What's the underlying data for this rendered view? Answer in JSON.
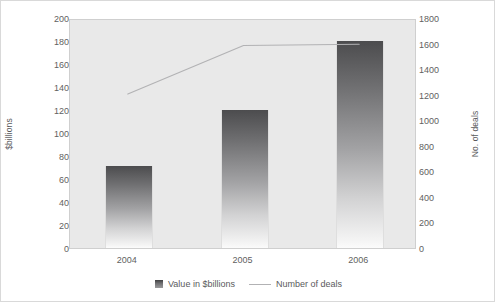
{
  "chart_data": {
    "type": "bar",
    "title": "",
    "subtitle": "",
    "xlabel": "",
    "categories": [
      "2004",
      "2005",
      "2006"
    ],
    "grid": false,
    "legend_position": "bottom",
    "series": [
      {
        "name": "Value in $billions",
        "type": "bar",
        "axis": "left",
        "values": [
          71,
          120,
          180
        ]
      },
      {
        "name": "Number of deals",
        "type": "line",
        "axis": "right",
        "values": [
          1220,
          1600,
          1610
        ]
      }
    ],
    "axes": {
      "left": {
        "label": "$billions",
        "ylim": [
          0,
          200
        ],
        "tick_step": 20,
        "ticks": [
          "200",
          "180",
          "160",
          "140",
          "120",
          "100",
          "80",
          "60",
          "40",
          "20",
          "0"
        ]
      },
      "right": {
        "label": "No. of deals",
        "ylim": [
          0,
          1800
        ],
        "tick_step": 200,
        "ticks": [
          "1800",
          "1600",
          "1400",
          "1200",
          "1000",
          "800",
          "600",
          "400",
          "200",
          "0"
        ]
      }
    },
    "legend": [
      {
        "label": "Value in $billions",
        "marker": "bar-swatch-icon"
      },
      {
        "label": "Number of deals",
        "marker": "line-swatch-icon"
      }
    ],
    "colors": {
      "plot_background": "#e9e9e9",
      "plot_border": "#cfcfcf",
      "bar_top": "#4c4c4e",
      "bar_bottom": "#fbfbfb",
      "line": "#b2b2b4",
      "tick_text": "#5f5f61",
      "figure_border": "#d9d9d9"
    }
  }
}
